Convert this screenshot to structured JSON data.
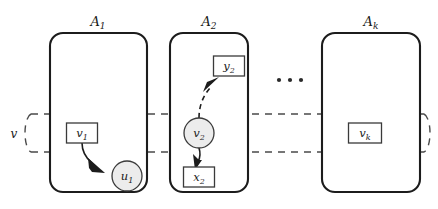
{
  "figure": {
    "caption_title": "Agent-local variable copies coupled across a shared variable band",
    "background_color": "#ffffff",
    "ink_color": "#1c1c1c",
    "dashed_color": "#4a4a4a",
    "circle_fill": "#ececec"
  },
  "agents": [
    {
      "id": "agent-1",
      "label_base": "A",
      "label_sub": "1",
      "box": {
        "x": 50,
        "y": 33,
        "w": 97,
        "h": 159,
        "r": 13
      },
      "label_pos": {
        "x": 98,
        "y": 25
      }
    },
    {
      "id": "agent-2",
      "label_base": "A",
      "label_sub": "2",
      "box": {
        "x": 170,
        "y": 33,
        "w": 78,
        "h": 159,
        "r": 13
      },
      "label_pos": {
        "x": 209,
        "y": 25
      }
    },
    {
      "id": "agent-k",
      "label_base": "A",
      "label_sub": "k",
      "box": {
        "x": 322,
        "y": 33,
        "w": 98,
        "h": 159,
        "r": 13
      },
      "label_pos": {
        "x": 371,
        "y": 25
      }
    }
  ],
  "band": {
    "label": "v",
    "label_pos": {
      "x": 14,
      "y": 138
    },
    "top_y": 114,
    "bottom_y": 152,
    "left_x": 31,
    "right_x": 424,
    "cap_rx": 9,
    "cap_ry": 19
  },
  "nodes": [
    {
      "id": "node-v1",
      "shape": "box",
      "base": "v",
      "sub": "1",
      "cx": 82,
      "cy": 133,
      "w": 31,
      "h": 20
    },
    {
      "id": "node-u1",
      "shape": "circle",
      "base": "u",
      "sub": "1",
      "cx": 127,
      "cy": 176,
      "r": 15
    },
    {
      "id": "node-y2",
      "shape": "box",
      "base": "y",
      "sub": "2",
      "cx": 229,
      "cy": 66,
      "w": 31,
      "h": 20
    },
    {
      "id": "node-v2",
      "shape": "circle",
      "base": "v",
      "sub": "2",
      "cx": 199,
      "cy": 133,
      "r": 15
    },
    {
      "id": "node-x2",
      "shape": "box",
      "base": "x",
      "sub": "2",
      "cx": 199,
      "cy": 177,
      "w": 31,
      "h": 20
    },
    {
      "id": "node-vk",
      "shape": "box",
      "base": "v",
      "sub": "k",
      "cx": 365,
      "cy": 133,
      "w": 33,
      "h": 20
    }
  ],
  "edges": [
    {
      "id": "edge-v1-u1",
      "style": "solid",
      "from": "node-v1",
      "to": "node-u1",
      "path": "M 82 143 C 82 152 86 158 92 163",
      "arrow": {
        "x": 100,
        "y": 170,
        "angle": 44
      }
    },
    {
      "id": "edge-v2-y2",
      "style": "dashed",
      "from": "node-v2",
      "to": "node-y2",
      "path": "M 199 118 C 199 106 203 96 210 88",
      "arrow": {
        "x": 215,
        "y": 82,
        "angle": -50
      }
    },
    {
      "id": "edge-v2-x2",
      "style": "solid",
      "from": "node-v2",
      "to": "node-x2",
      "path": "M 199 148 C 200 154 199 158 197 162",
      "arrow": {
        "x": 196,
        "y": 167,
        "angle": 100
      }
    }
  ],
  "ellipsis": {
    "label": "...",
    "dots": [
      {
        "cx": 279,
        "cy": 80,
        "r": 2.1
      },
      {
        "cx": 290,
        "cy": 80,
        "r": 2.1
      },
      {
        "cx": 301,
        "cy": 80,
        "r": 2.1
      }
    ]
  }
}
